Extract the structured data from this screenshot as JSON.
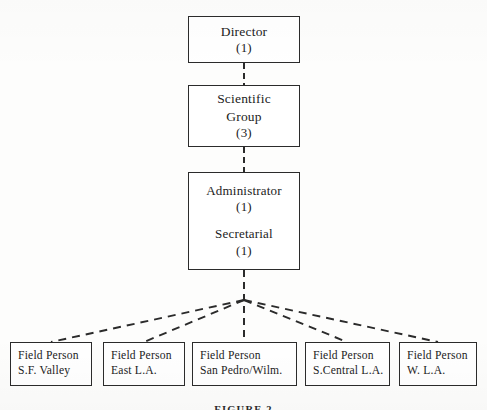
{
  "figure": {
    "caption": "FIGURE 2",
    "background_color": "#fdfdfc",
    "line_color": "#2b2b2b"
  },
  "hierarchy": {
    "director": {
      "title": "Director",
      "count": "(1)"
    },
    "scientific_group": {
      "title_line1": "Scientific",
      "title_line2": "Group",
      "count": "(3)"
    },
    "administration": {
      "administrator_title": "Administrator",
      "administrator_count": "(1)",
      "secretarial_title": "Secretarial",
      "secretarial_count": "(1)"
    },
    "field_staff": [
      {
        "role": "Field Person",
        "area": "S.F. Valley"
      },
      {
        "role": "Field Person",
        "area": "East L.A."
      },
      {
        "role": "Field Person",
        "area": "San Pedro/Wilm."
      },
      {
        "role": "Field Person",
        "area": "S.Central L.A."
      },
      {
        "role": "Field Person",
        "area": "W. L.A."
      }
    ]
  },
  "connectors": {
    "director_to_group": "dashed-vertical",
    "group_to_admin": "dashed-vertical",
    "admin_to_field": "dashed-fan"
  }
}
